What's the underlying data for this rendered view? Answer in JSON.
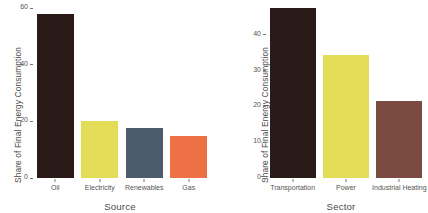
{
  "chart_data": [
    {
      "type": "bar",
      "panel": "left",
      "title": "",
      "xlabel": "Source",
      "ylabel": "Share of Final Energy Consumption",
      "categories": [
        "Oil",
        "Electricity",
        "Renewables",
        "Gas"
      ],
      "values": [
        58,
        20,
        17.5,
        15
      ],
      "colors": [
        "#2b1b18",
        "#e2dc56",
        "#4c5b6d",
        "#ee7145"
      ],
      "ylim": [
        0,
        60
      ],
      "yticks": [
        0,
        20,
        40,
        60
      ],
      "ytick_labels": [
        "0",
        "20",
        "40",
        "60"
      ],
      "grid": false,
      "legend": "none"
    },
    {
      "type": "bar",
      "panel": "right",
      "title": "",
      "xlabel": "Sector",
      "ylabel": "Share of Final Energy Consumption",
      "categories": [
        "Transportation",
        "Power",
        "Industrial Heating"
      ],
      "values": [
        47.5,
        34.5,
        21.5
      ],
      "colors": [
        "#2b1b18",
        "#e2dc56",
        "#7b4b42"
      ],
      "ylim": [
        0,
        47.5
      ],
      "yticks": [
        0,
        10,
        20,
        30,
        40
      ],
      "ytick_labels": [
        "0",
        "10",
        "20",
        "30",
        "40"
      ],
      "grid": false,
      "legend": "none"
    }
  ]
}
